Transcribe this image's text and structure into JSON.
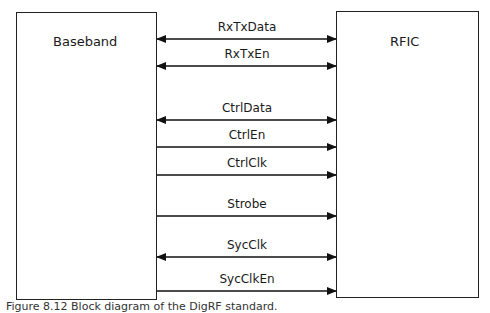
{
  "blocks": {
    "left": {
      "label": "Baseband"
    },
    "right": {
      "label": "RFIC"
    }
  },
  "signals": [
    {
      "label": "RxTxData",
      "direction": "bidirectional",
      "y": 39
    },
    {
      "label": "RxTxEn",
      "direction": "bidirectional",
      "y": 66
    },
    {
      "label": "CtrlData",
      "direction": "bidirectional",
      "y": 120
    },
    {
      "label": "CtrlEn",
      "direction": "to-right",
      "y": 147
    },
    {
      "label": "CtrlClk",
      "direction": "to-right",
      "y": 175
    },
    {
      "label": "Strobe",
      "direction": "to-right",
      "y": 216
    },
    {
      "label": "SycClk",
      "direction": "bidirectional",
      "y": 257
    },
    {
      "label": "SycClkEn",
      "direction": "to-right",
      "y": 291
    }
  ],
  "caption": "Figure 8.12  Block diagram of the DigRF standard."
}
